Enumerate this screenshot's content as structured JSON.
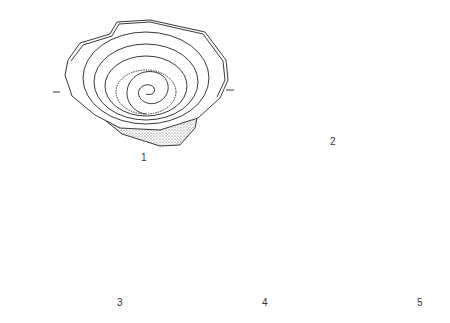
{
  "figure": {
    "panels": [
      {
        "id": 1,
        "label": "1",
        "subject": "bowl-spiral-interior-view"
      },
      {
        "id": 2,
        "label": "2",
        "subject": "bowl-cross-section"
      },
      {
        "id": 3,
        "label": "3",
        "subject": "base-parallel-straight-strokes"
      },
      {
        "id": 4,
        "label": "4",
        "subject": "base-parallel-curved-strokes"
      },
      {
        "id": 5,
        "label": "5",
        "subject": "base-nested-loop-spiral"
      }
    ],
    "colors": {
      "ink": "#222222",
      "background": "#ffffff",
      "stipple": "#888888"
    }
  }
}
